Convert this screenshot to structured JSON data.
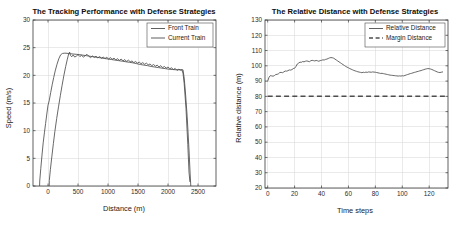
{
  "figure": {
    "width": 459,
    "height": 229,
    "background": "#ffffff",
    "line_color": "#4d4d4d",
    "axis_color": "#3a3a3a",
    "grid_color": "#d6d6d6"
  },
  "chart_data": [
    {
      "id": "tracking-performance",
      "type": "line",
      "title": "The Tracking Performance with Defense Strategies",
      "xlabel": "Distance (m)",
      "ylabel": "Speed (m/s)",
      "xlim": [
        -250,
        2800
      ],
      "ylim": [
        0,
        30
      ],
      "xticks": [
        0,
        500,
        1000,
        1500,
        2000,
        2500
      ],
      "yticks": [
        0,
        5,
        10,
        15,
        20,
        25,
        30
      ],
      "xticklabels": [
        "0",
        "500",
        "1000",
        "1500",
        "2000",
        "2500"
      ],
      "yticklabels": [
        "0",
        "5",
        "10",
        "15",
        "20",
        "25",
        "30"
      ],
      "grid": true,
      "legend_position": "upper right",
      "series": [
        {
          "name": "Front Train",
          "style": "solid",
          "color": "#4d4d4d",
          "x": [
            -140,
            -138,
            -120,
            -100,
            -80,
            -60,
            -40,
            -20,
            0,
            20,
            45,
            70,
            95,
            120,
            150,
            180,
            210,
            240,
            270,
            300,
            340,
            380,
            420,
            470,
            520,
            580,
            640,
            700,
            760,
            820,
            880,
            940,
            1000,
            1060,
            1120,
            1180,
            1240,
            1300,
            1360,
            1420,
            1480,
            1540,
            1600,
            1660,
            1720,
            1780,
            1840,
            1900,
            1960,
            2020,
            2080,
            2140,
            2200,
            2250,
            2270,
            2290,
            2320,
            2350,
            2370,
            2380
          ],
          "y": [
            0,
            0.9,
            3.2,
            5.6,
            7.8,
            9.6,
            11.3,
            13.0,
            14.6,
            15.4,
            16.9,
            18.3,
            19.6,
            20.8,
            22.0,
            23.0,
            23.7,
            23.95,
            24.0,
            24.0,
            23.95,
            23.9,
            23.85,
            23.8,
            23.75,
            23.65,
            23.55,
            23.45,
            23.35,
            23.25,
            23.15,
            23.05,
            22.95,
            22.85,
            22.75,
            22.65,
            22.55,
            22.45,
            22.35,
            22.25,
            22.1,
            21.95,
            21.85,
            21.75,
            21.6,
            21.5,
            21.4,
            21.3,
            21.2,
            21.1,
            21.05,
            21.0,
            21.0,
            21.0,
            19.5,
            17.0,
            12.5,
            6.5,
            2.0,
            0
          ]
        },
        {
          "name": "Current Train",
          "style": "solid",
          "color": "#4d4d4d",
          "x": [
            20,
            22,
            40,
            65,
            90,
            115,
            145,
            175,
            205,
            235,
            265,
            295,
            320,
            345,
            360,
            375,
            395,
            420,
            445,
            470,
            500,
            530,
            560,
            590,
            620,
            650,
            680,
            710,
            740,
            770,
            800,
            830,
            860,
            890,
            920,
            950,
            980,
            1010,
            1040,
            1070,
            1100,
            1130,
            1160,
            1190,
            1220,
            1250,
            1280,
            1310,
            1340,
            1370,
            1400,
            1430,
            1460,
            1490,
            1520,
            1550,
            1580,
            1610,
            1640,
            1670,
            1700,
            1730,
            1760,
            1790,
            1820,
            1850,
            1880,
            1910,
            1940,
            1970,
            2000,
            2030,
            2060,
            2090,
            2120,
            2150,
            2180,
            2210,
            2230,
            2250,
            2270,
            2300,
            2330,
            2350,
            2365
          ],
          "y": [
            0,
            1.0,
            3.0,
            5.4,
            7.7,
            9.9,
            12.2,
            14.3,
            16.3,
            18.2,
            20.0,
            21.6,
            22.8,
            23.9,
            24.2,
            23.6,
            23.35,
            23.7,
            23.3,
            23.45,
            23.75,
            23.4,
            23.6,
            23.3,
            23.55,
            23.8,
            23.45,
            23.2,
            23.5,
            23.25,
            23.45,
            23.15,
            23.4,
            23.1,
            23.3,
            23.05,
            23.25,
            22.95,
            23.2,
            22.9,
            23.1,
            22.8,
            23.0,
            22.7,
            22.95,
            22.6,
            22.85,
            22.5,
            22.75,
            22.45,
            22.6,
            22.3,
            22.5,
            22.2,
            22.4,
            22.1,
            22.3,
            22.0,
            22.2,
            21.9,
            22.05,
            21.75,
            21.95,
            21.65,
            21.85,
            21.5,
            21.75,
            21.4,
            21.6,
            21.3,
            21.5,
            21.2,
            21.35,
            21.05,
            21.25,
            20.9,
            21.1,
            20.95,
            21.0,
            20.4,
            18.5,
            14.0,
            7.5,
            2.5,
            0.8
          ]
        }
      ]
    },
    {
      "id": "relative-distance",
      "type": "line",
      "title": "The Relative Distance with Defense Strategies",
      "xlabel": "Time steps",
      "ylabel": "Relative distance (m)",
      "xlim": [
        -2,
        134
      ],
      "ylim": [
        20,
        130
      ],
      "xticks": [
        0,
        20,
        40,
        60,
        80,
        100,
        120
      ],
      "yticks": [
        20,
        30,
        40,
        50,
        60,
        70,
        80,
        90,
        100,
        110,
        120,
        130
      ],
      "xticklabels": [
        "0",
        "20",
        "40",
        "60",
        "80",
        "100",
        "120"
      ],
      "yticklabels": [
        "20",
        "30",
        "40",
        "50",
        "60",
        "70",
        "80",
        "90",
        "100",
        "110",
        "120",
        "130"
      ],
      "grid": true,
      "legend_position": "upper right",
      "series": [
        {
          "name": "Relative Distance",
          "style": "solid",
          "color": "#4d4d4d",
          "x": [
            0,
            1,
            2,
            3,
            4,
            5,
            6,
            7,
            8,
            9,
            10,
            11,
            12,
            13,
            14,
            15,
            16,
            17,
            18,
            19,
            20,
            21,
            22,
            23,
            24,
            25,
            26,
            27,
            28,
            29,
            30,
            31,
            32,
            33,
            34,
            35,
            36,
            37,
            38,
            39,
            40,
            41,
            42,
            43,
            44,
            45,
            46,
            47,
            48,
            49,
            50,
            51,
            52,
            53,
            54,
            55,
            56,
            57,
            58,
            59,
            60,
            61,
            62,
            63,
            64,
            65,
            66,
            67,
            68,
            69,
            70,
            71,
            72,
            73,
            74,
            75,
            76,
            77,
            78,
            79,
            80,
            81,
            82,
            83,
            84,
            85,
            86,
            87,
            88,
            89,
            90,
            91,
            92,
            93,
            94,
            95,
            96,
            97,
            98,
            99,
            100,
            101,
            102,
            103,
            104,
            105,
            106,
            107,
            108,
            109,
            110,
            111,
            112,
            113,
            114,
            115,
            116,
            117,
            118,
            119,
            120,
            121,
            122,
            123,
            124,
            125,
            126,
            127,
            128,
            129,
            130,
            131,
            132
          ],
          "y": [
            90.0,
            92.5,
            93.6,
            93.4,
            93.2,
            93.6,
            94.3,
            94.4,
            94.8,
            95.6,
            95.7,
            95.5,
            96.0,
            96.6,
            96.5,
            96.8,
            97.3,
            97.2,
            97.5,
            98.2,
            98.4,
            99.6,
            101.2,
            101.8,
            102.4,
            102.3,
            102.8,
            102.6,
            103.0,
            103.2,
            103.0,
            102.7,
            103.3,
            103.6,
            103.4,
            103.2,
            103.5,
            103.3,
            103.0,
            103.4,
            103.6,
            103.9,
            103.8,
            104.2,
            104.4,
            104.8,
            105.2,
            105.4,
            105.3,
            105.0,
            104.4,
            103.8,
            103.2,
            102.6,
            102.0,
            101.4,
            100.8,
            100.2,
            99.6,
            99.1,
            98.7,
            98.2,
            97.8,
            97.4,
            97.0,
            96.7,
            96.4,
            96.1,
            95.9,
            95.7,
            95.5,
            95.8,
            95.6,
            95.9,
            95.7,
            96.0,
            95.9,
            95.8,
            96.0,
            95.9,
            95.8,
            95.6,
            95.4,
            95.2,
            95.0,
            95.1,
            94.9,
            94.7,
            94.5,
            94.3,
            94.1,
            93.9,
            93.8,
            93.7,
            93.6,
            93.5,
            93.4,
            93.3,
            93.4,
            93.3,
            93.5,
            93.4,
            93.7,
            94.0,
            94.3,
            94.6,
            94.9,
            95.1,
            95.4,
            95.7,
            95.9,
            96.2,
            96.4,
            96.7,
            96.9,
            97.2,
            97.5,
            97.8,
            98.0,
            98.2,
            98.1,
            97.9,
            97.6,
            97.2,
            96.8,
            96.4,
            96.0,
            95.7,
            95.6,
            95.8,
            96.0
          ]
        },
        {
          "name": "Margin Distance",
          "style": "dashed",
          "color": "#4d4d4d",
          "constant_y": 80,
          "x": [
            0,
            132
          ],
          "y": [
            80,
            80
          ]
        }
      ]
    }
  ]
}
